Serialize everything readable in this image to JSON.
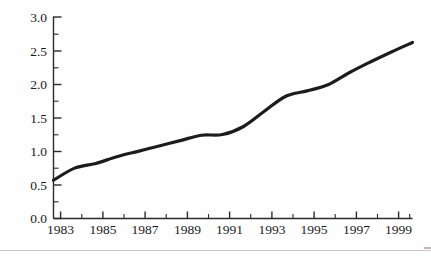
{
  "figure": {
    "background_color": "#fefefe",
    "line_color": "#1c1c1c",
    "axis_color": "#2b2b2b",
    "text_color": "#1a1a1a",
    "rule_color": "#c9c6c6"
  },
  "chart_data": {
    "type": "line",
    "title": "",
    "subtitle": "",
    "xlabel": "",
    "ylabel": "",
    "xlim": [
      1983,
      2000
    ],
    "ylim": [
      0.0,
      3.0
    ],
    "grid": false,
    "legend": null,
    "legend_position": "none",
    "y_ticks": [
      "0.0",
      "0.5",
      "1.0",
      "1.5",
      "2.0",
      "2.5",
      "3.0"
    ],
    "y_tick_values": [
      0.0,
      0.5,
      1.0,
      1.5,
      2.0,
      2.5,
      3.0
    ],
    "y_minor_tick_values": [
      0.25,
      0.75,
      1.25,
      1.75,
      2.25,
      2.75
    ],
    "x_ticks": [
      "1983",
      "1985",
      "1987",
      "1989",
      "1991",
      "1993",
      "1995",
      "1997",
      "1999"
    ],
    "x_tick_values": [
      1983,
      1985,
      1987,
      1989,
      1991,
      1993,
      1995,
      1997,
      1999
    ],
    "x_minor_tick_values": [
      1984,
      1986,
      1988,
      1990,
      1992,
      1994,
      1996,
      1998,
      2000
    ],
    "x": [
      1983,
      1984,
      1985,
      1986,
      1987,
      1988,
      1989,
      1990,
      1991,
      1992,
      1993,
      1994,
      1995,
      1996,
      1997,
      1998,
      1999,
      2000
    ],
    "series": [
      {
        "name": "series-1",
        "color": "#1c1c1c",
        "line_width": 3.2,
        "values": [
          0.57,
          0.75,
          0.82,
          0.92,
          1.0,
          1.08,
          1.16,
          1.24,
          1.25,
          1.37,
          1.6,
          1.82,
          1.9,
          1.99,
          2.17,
          2.33,
          2.48,
          2.62
        ]
      }
    ],
    "annotations": []
  },
  "artifacts": {
    "bottom_rule_label": "page-rule"
  }
}
